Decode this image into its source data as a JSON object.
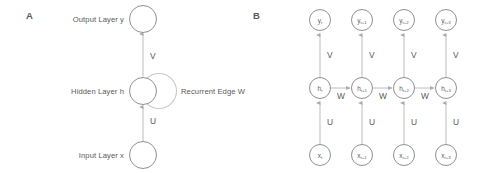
{
  "figure": {
    "background_color": "#ffffff",
    "line_color": "#c2c3c5",
    "node_stroke_color": "#8f9093",
    "text_color": "#58595b",
    "width": 484,
    "height": 173
  },
  "panel_a": {
    "letter": "A",
    "caption_output": "Output Layer y",
    "caption_hidden": "Hidden Layer h",
    "caption_input": "Input Layer x",
    "weight_hidden_to_output": "V",
    "weight_input_to_hidden": "U",
    "recurrent_label": "Recurrent Edge W",
    "nodes": [
      {
        "name": "output-node",
        "cx": 143,
        "cy": 19,
        "r": 13.5
      },
      {
        "name": "hidden-node",
        "cx": 143,
        "cy": 91,
        "r": 13.5
      },
      {
        "name": "input-node",
        "cx": 143,
        "cy": 155,
        "r": 13.5
      }
    ],
    "edges": [
      {
        "name": "edge-hidden-to-output",
        "label": "V",
        "label_x": 150,
        "label_y": 59
      },
      {
        "name": "edge-input-to-hidden",
        "label": "U",
        "label_x": 150,
        "label_y": 124
      }
    ],
    "self_loop": {
      "cx": 159,
      "cy": 91,
      "r": 17.5
    }
  },
  "panel_b": {
    "letter": "B",
    "weight_hidden_to_output": "V",
    "weight_input_to_hidden": "U",
    "weight_recurrent": "W",
    "timesteps": [
      {
        "x": 320,
        "output": {
          "base": "y",
          "sub": "t"
        },
        "hidden": {
          "base": "h",
          "sub": "t"
        },
        "input": {
          "base": "x",
          "sub": "t"
        }
      },
      {
        "x": 362,
        "output": {
          "base": "y",
          "sub": "t+1"
        },
        "hidden": {
          "base": "h",
          "sub": "t+1"
        },
        "input": {
          "base": "x",
          "sub": "t+1"
        }
      },
      {
        "x": 404,
        "output": {
          "base": "y",
          "sub": "t+2"
        },
        "hidden": {
          "base": "h",
          "sub": "t+2"
        },
        "input": {
          "base": "x",
          "sub": "t+2"
        }
      },
      {
        "x": 446,
        "output": {
          "base": "y",
          "sub": "t+3"
        },
        "hidden": {
          "base": "h",
          "sub": "t+3"
        },
        "input": {
          "base": "x",
          "sub": "t+3"
        }
      }
    ],
    "recurrent_connections": [
      {
        "label": "W",
        "x": 341,
        "y": 97
      },
      {
        "label": "W",
        "x": 383,
        "y": 97
      },
      {
        "label": "W",
        "x": 425,
        "y": 97
      }
    ],
    "row_y": {
      "output": 20,
      "hidden": 88,
      "input": 155
    },
    "node_radius": 10.5
  }
}
